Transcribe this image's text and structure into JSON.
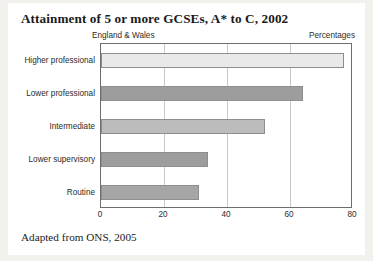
{
  "card": {
    "caption": "Adapted from ONS, 2005",
    "subtitle_left": "England & Wales",
    "subtitle_right": "Percentages"
  },
  "chart_data": {
    "type": "bar",
    "orientation": "horizontal",
    "title": "Attainment of 5 or more GCSEs, A* to C, 2002",
    "subtitle": "England & Wales",
    "unit_label": "Percentages",
    "source_note": "Adapted from ONS, 2005",
    "categories": [
      "Higher professional",
      "Lower professional",
      "Intermediate",
      "Lower supervisory",
      "Routine"
    ],
    "values": [
      77,
      64,
      52,
      34,
      31
    ],
    "colors": [
      "#e9e9e9",
      "#9d9d9d",
      "#bcbcbc",
      "#9d9d9d",
      "#a6a6a6"
    ],
    "xlabel": "",
    "ylabel": "",
    "xlim": [
      0,
      80
    ],
    "xticks": [
      0,
      20,
      40,
      60,
      80
    ],
    "grid": true,
    "grid_axis": "x",
    "legend": false
  }
}
